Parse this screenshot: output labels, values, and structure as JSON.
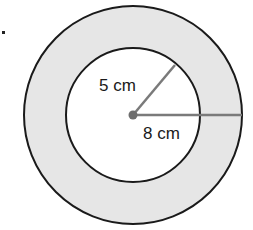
{
  "diagram": {
    "type": "annulus",
    "bullet": ".",
    "center": {
      "x": 133,
      "y": 115
    },
    "outer_circle": {
      "radius_px": 109,
      "fill": "#e6e6e6",
      "stroke": "#1a1a1a"
    },
    "inner_circle": {
      "radius_px": 67,
      "fill": "#ffffff",
      "stroke": "#1a1a1a"
    },
    "radius_line_color": "#7a7a7a",
    "labels": {
      "inner_radius": "5 cm",
      "outer_radius": "8 cm"
    }
  }
}
